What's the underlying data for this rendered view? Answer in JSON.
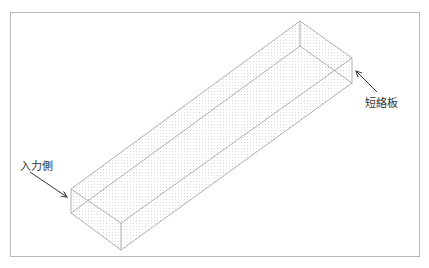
{
  "figure": {
    "type": "3d-waveguide-box-diagram",
    "labels": {
      "input_side": "入力側",
      "short_plate": "短絡板"
    },
    "colors": {
      "edge": "#9a9a9a",
      "mesh_dots": "#b5b5b5",
      "arrow": "#333333",
      "frame": "#b8b8b8"
    }
  }
}
